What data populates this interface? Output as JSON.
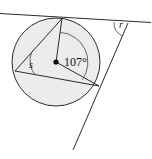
{
  "figure": {
    "type": "geometry-diagram",
    "background_color": "#ffffff",
    "line_color": "#2b2b2b",
    "circle_fill_color": "#ececec",
    "arc_color": "#555555"
  },
  "labels": {
    "central_angle": "107°",
    "inscribed_angle": "s",
    "exterior_angle": "r"
  },
  "geometry": {
    "circle": {
      "center_x": 56,
      "center_y": 62,
      "radius": 44
    },
    "points": {
      "center": {
        "x": 56,
        "y": 62,
        "name": "O"
      },
      "top_tangency": {
        "x": 62,
        "y": 18,
        "name": "A"
      },
      "right_tangency": {
        "x": 99,
        "y": 86,
        "name": "B"
      },
      "left_vertex": {
        "x": 15,
        "y": 71,
        "name": "C"
      },
      "external_vertex": {
        "x": 128,
        "y": 23,
        "name": "P"
      }
    },
    "segments": [
      {
        "from": "center",
        "to": "top_tangency",
        "name": "radius-to-top"
      },
      {
        "from": "center",
        "to": "right_tangency",
        "name": "radius-to-right"
      },
      {
        "from": "left_vertex",
        "to": "top_tangency",
        "name": "chord-left-top"
      },
      {
        "from": "left_vertex",
        "to": "right_tangency",
        "name": "chord-left-right"
      }
    ],
    "tangent_lines": [
      {
        "name": "upper-tangent",
        "x1": 0,
        "y1": 14,
        "x2": 150,
        "y2": 23
      },
      {
        "name": "lower-tangent",
        "x1": 128,
        "y1": 23,
        "x2": 73,
        "y2": 150
      }
    ],
    "arcs": {
      "central_arc_radius": 30,
      "inscribed_arc_radius": 22,
      "exterior_arc_radius": 14
    }
  },
  "canvas": {
    "width": 152,
    "height": 159
  }
}
